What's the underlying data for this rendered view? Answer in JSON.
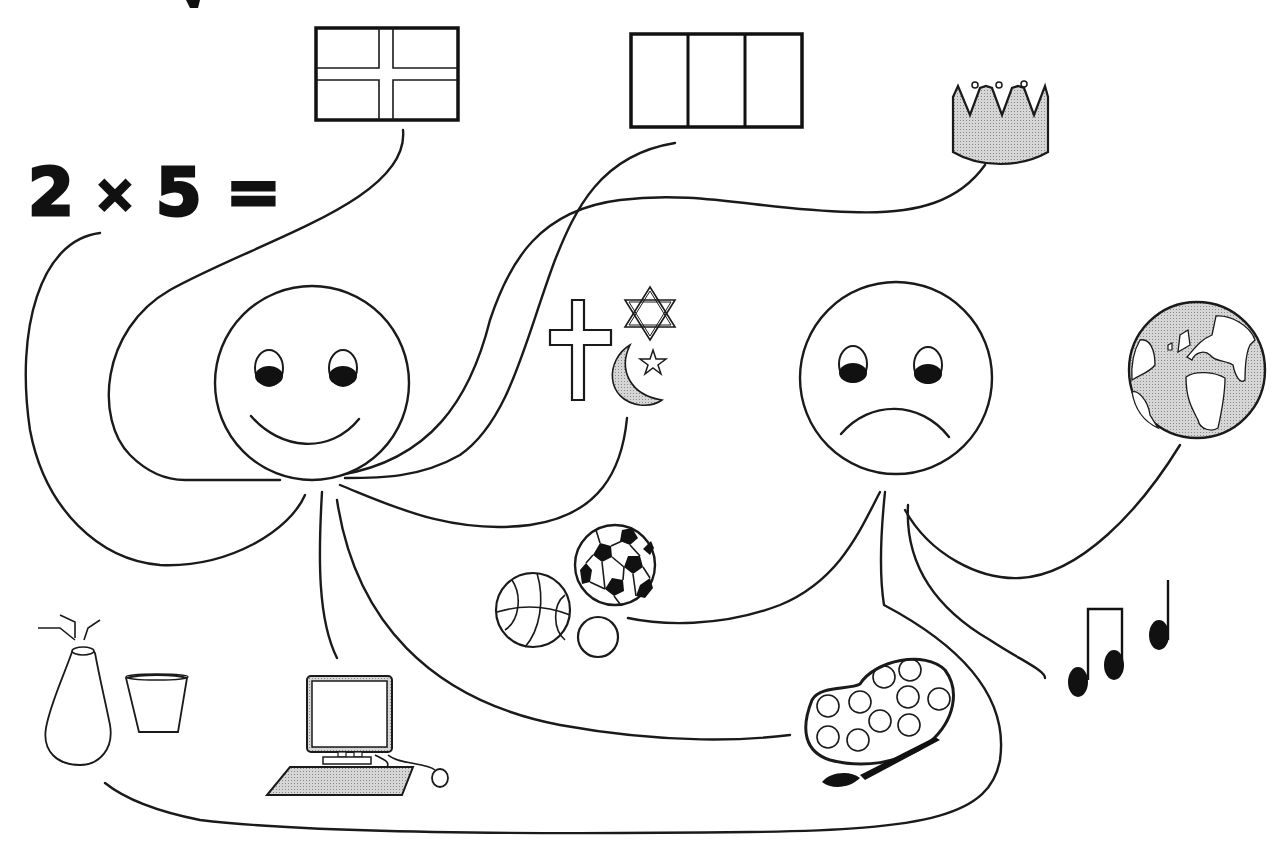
{
  "equation": {
    "left": "2",
    "operator": "×",
    "right": "5",
    "equals": "="
  },
  "figures": {
    "happy_face": {
      "expression": "smile",
      "center": [
        312,
        383
      ],
      "radius": 97
    },
    "sad_face": {
      "expression": "frown",
      "center": [
        896,
        378
      ],
      "radius": 96
    }
  },
  "symbols": [
    {
      "id": "flag-cross",
      "label": "flag with cross"
    },
    {
      "id": "flag-tricolor",
      "label": "three-band flag"
    },
    {
      "id": "crown",
      "label": "crown"
    },
    {
      "id": "religion",
      "label": "religious symbols (cross, star of David, crescent and star)"
    },
    {
      "id": "globe",
      "label": "globe"
    },
    {
      "id": "sports-balls",
      "label": "basketball, soccer ball and small ball"
    },
    {
      "id": "music-notes",
      "label": "music notes"
    },
    {
      "id": "paint-palette",
      "label": "paint palette with brush"
    },
    {
      "id": "computer",
      "label": "desktop computer with keyboard and mouse"
    },
    {
      "id": "vase-cup",
      "label": "vase with flowers and cup"
    }
  ],
  "colors": {
    "ink": "#1a1a1a",
    "fill_gray": "#c9c9c9",
    "background": "#ffffff"
  }
}
